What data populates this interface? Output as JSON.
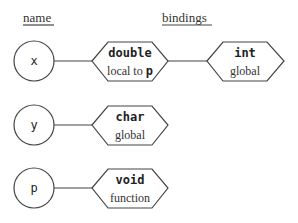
{
  "headers": {
    "name": "name",
    "bindings": "bindings"
  },
  "rows": [
    {
      "name": "x",
      "bindings": [
        {
          "type": "double",
          "scope": "local to ",
          "scope_code": "p"
        },
        {
          "type": "int",
          "scope": "global"
        }
      ]
    },
    {
      "name": "y",
      "bindings": [
        {
          "type": "char",
          "scope": "global"
        }
      ]
    },
    {
      "name": "p",
      "bindings": [
        {
          "type": "void",
          "scope": "function"
        }
      ]
    }
  ],
  "colors": {
    "stroke": "#444444",
    "text": "#333333",
    "background": "#ffffff"
  }
}
